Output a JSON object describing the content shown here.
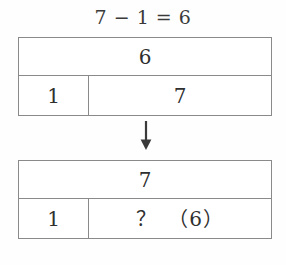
{
  "title": {
    "equation": "7 − 1 = 6"
  },
  "tables": [
    {
      "name": "before",
      "whole": "6",
      "parts": [
        "1",
        "7"
      ]
    },
    {
      "name": "after",
      "whole": "7",
      "parts": [
        "1",
        "？　（6）"
      ]
    }
  ],
  "arrow": {
    "icon": "arrow-down-icon",
    "direction": "down"
  },
  "colors": {
    "border": "#8a8a8a",
    "text": "#2f2f2f",
    "title_text": "#3a3a3a",
    "background": "#fefefe"
  }
}
